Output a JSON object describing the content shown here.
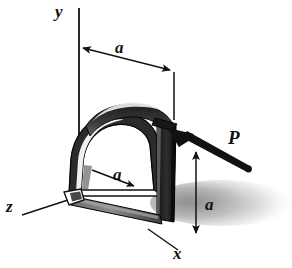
{
  "figure": {
    "type": "engineering-mechanics-diagram",
    "background_color": "#ffffff",
    "ink_color": "#111111",
    "shadow_color": "#a9a9a9",
    "bar_dark_color": "#262626",
    "bar_mid_color": "#585858",
    "bar_light_color": "#d8d8d8"
  },
  "axes": {
    "y": {
      "label": "y",
      "direction": "vertical-up"
    },
    "z": {
      "label": "z",
      "direction": "lower-left"
    },
    "x": {
      "label": "x",
      "direction": "lower-right"
    },
    "origin_hint": "base of the bent bar"
  },
  "dimensions": [
    {
      "id": "top",
      "label": "a",
      "description": "horizontal offset from y axis to the loaded corner",
      "arrow": "double"
    },
    {
      "id": "inner",
      "label": "a",
      "description": "depth of the bar along z, interior diagonal",
      "arrow": "single"
    },
    {
      "id": "right",
      "label": "a",
      "description": "height of the loaded corner above the xz plane",
      "arrow": "double"
    }
  ],
  "force": {
    "label": "P",
    "description": "concentrated force applied at the top corner of the vertical leg, directed up and to the left",
    "style": "thick-solid-arrow"
  },
  "object": {
    "name": "bent bar",
    "shape": "semicircular arch joined to a straight vertical leg",
    "rendering": "shaded solid with cast shadow"
  }
}
